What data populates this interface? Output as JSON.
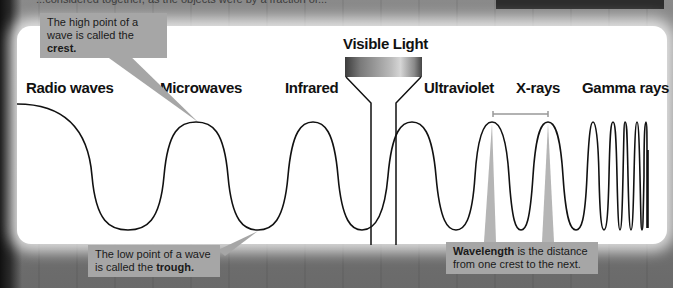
{
  "page": {
    "top_text_fragment": "...considered together, as the objects were by a fraction of...",
    "top_right_box_text": ""
  },
  "diagram": {
    "bands": [
      {
        "id": "radio",
        "label": "Radio waves"
      },
      {
        "id": "microwave",
        "label": "Microwaves"
      },
      {
        "id": "infrared",
        "label": "Infrared"
      },
      {
        "id": "visible",
        "label": "Visible Light"
      },
      {
        "id": "ultraviolet",
        "label": "Ultraviolet"
      },
      {
        "id": "xray",
        "label": "X-rays"
      },
      {
        "id": "gamma",
        "label": "Gamma rays"
      }
    ],
    "callouts": {
      "crest": {
        "text": "The high point of a wave is called the ",
        "bold": "crest."
      },
      "trough": {
        "text": "The low point of a wave is called the ",
        "bold": "trough."
      },
      "wavelength": {
        "bold": "Wavelength",
        "text": " is the distance from one crest to the next."
      }
    },
    "colors": {
      "panel": "#ffffff",
      "callout_bg": "#a6a6a6",
      "wave_stroke": "#111111",
      "background": "#6e6e6e"
    }
  }
}
